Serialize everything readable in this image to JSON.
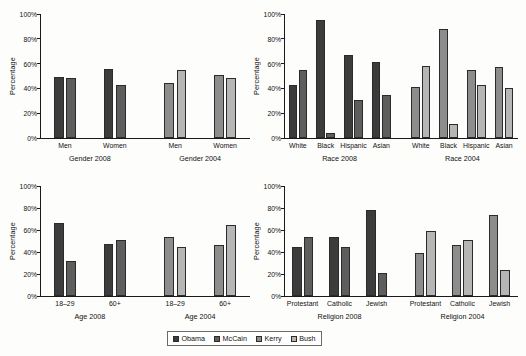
{
  "figure": {
    "ylabel": "Percentage",
    "yticks": [
      "0%",
      "20%",
      "40%",
      "60%",
      "80%",
      "100%"
    ],
    "ymin": 0,
    "ymax": 100
  },
  "legend": {
    "items": [
      {
        "label": "Obama",
        "color": "#3c3c3c"
      },
      {
        "label": "McCain",
        "color": "#5e5e5e"
      },
      {
        "label": "Kerry",
        "color": "#8d8d8d"
      },
      {
        "label": "Bush",
        "color": "#b6b6b6"
      }
    ]
  },
  "chart_data": [
    {
      "id": "gender",
      "type": "bar",
      "title": "",
      "xlabel": "",
      "ylabel": "Percentage",
      "ylim": [
        0,
        100
      ],
      "grid": false,
      "groups": [
        {
          "name": "Gender 2008",
          "categories": [
            "Men",
            "Women"
          ],
          "series": [
            {
              "name": "Obama",
              "color": "#3c3c3c",
              "values": [
                49,
                56
              ]
            },
            {
              "name": "McCain",
              "color": "#5e5e5e",
              "values": [
                48,
                43
              ]
            }
          ]
        },
        {
          "name": "Gender 2004",
          "categories": [
            "Men",
            "Women"
          ],
          "series": [
            {
              "name": "Kerry",
              "color": "#8d8d8d",
              "values": [
                44,
                51
              ]
            },
            {
              "name": "Bush",
              "color": "#b6b6b6",
              "values": [
                55,
                48
              ]
            }
          ]
        }
      ]
    },
    {
      "id": "race",
      "type": "bar",
      "title": "",
      "xlabel": "",
      "ylabel": "Percentage",
      "ylim": [
        0,
        100
      ],
      "grid": false,
      "groups": [
        {
          "name": "Race 2008",
          "categories": [
            "White",
            "Black",
            "Hispanic",
            "Asian"
          ],
          "series": [
            {
              "name": "Obama",
              "color": "#3c3c3c",
              "values": [
                43,
                95,
                67,
                61
              ]
            },
            {
              "name": "McCain",
              "color": "#5e5e5e",
              "values": [
                55,
                4,
                31,
                35
              ]
            }
          ]
        },
        {
          "name": "Race 2004",
          "categories": [
            "White",
            "Black",
            "Hispanic",
            "Asian"
          ],
          "series": [
            {
              "name": "Kerry",
              "color": "#8d8d8d",
              "values": [
                41,
                88,
                55,
                57
              ]
            },
            {
              "name": "Bush",
              "color": "#b6b6b6",
              "values": [
                58,
                11,
                43,
                40
              ]
            }
          ]
        }
      ]
    },
    {
      "id": "age",
      "type": "bar",
      "title": "",
      "xlabel": "",
      "ylabel": "Percentage",
      "ylim": [
        0,
        100
      ],
      "grid": false,
      "groups": [
        {
          "name": "Age 2008",
          "categories": [
            "18–29",
            "60+"
          ],
          "series": [
            {
              "name": "Obama",
              "color": "#3c3c3c",
              "values": [
                66,
                47
              ]
            },
            {
              "name": "McCain",
              "color": "#5e5e5e",
              "values": [
                32,
                51
              ]
            }
          ]
        },
        {
          "name": "Age 2004",
          "categories": [
            "18–29",
            "60+"
          ],
          "series": [
            {
              "name": "Kerry",
              "color": "#8d8d8d",
              "values": [
                54,
                46
              ]
            },
            {
              "name": "Bush",
              "color": "#b6b6b6",
              "values": [
                45,
                65
              ]
            }
          ]
        }
      ]
    },
    {
      "id": "religion",
      "type": "bar",
      "title": "",
      "xlabel": "",
      "ylabel": "Percentage",
      "ylim": [
        0,
        100
      ],
      "grid": false,
      "groups": [
        {
          "name": "Religion 2008",
          "categories": [
            "Protestant",
            "Catholic",
            "Jewish"
          ],
          "series": [
            {
              "name": "Obama",
              "color": "#3c3c3c",
              "values": [
                45,
                54,
                78
              ]
            },
            {
              "name": "McCain",
              "color": "#5e5e5e",
              "values": [
                54,
                45,
                21
              ]
            }
          ]
        },
        {
          "name": "Religion 2004",
          "categories": [
            "Protestant",
            "Catholic",
            "Jewish"
          ],
          "series": [
            {
              "name": "Kerry",
              "color": "#8d8d8d",
              "values": [
                39,
                46,
                74
              ]
            },
            {
              "name": "Bush",
              "color": "#b6b6b6",
              "values": [
                59,
                51,
                24
              ]
            }
          ]
        }
      ]
    }
  ]
}
